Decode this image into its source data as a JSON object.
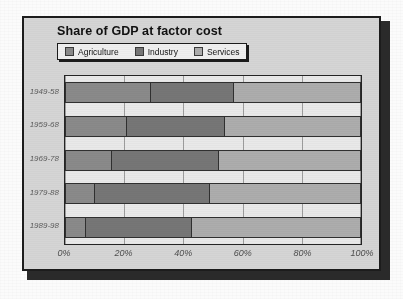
{
  "chart": {
    "title": "Share of GDP at factor cost",
    "legend": [
      {
        "label": "Agriculture",
        "color": "#8a8a8a",
        "icon": "legend-swatch-icon"
      },
      {
        "label": "Industry",
        "color": "#767676",
        "icon": "legend-swatch-icon"
      },
      {
        "label": "Services",
        "color": "#adadad",
        "icon": "legend-swatch-icon"
      }
    ],
    "panel_background": "#d5d5d5",
    "plot_background": "#e9e9e9",
    "border_color": "#1c1c1c"
  },
  "chart_data": {
    "type": "bar",
    "orientation": "horizontal",
    "stacked": true,
    "normalized": true,
    "title": "Share of GDP at factor cost",
    "xlabel": "",
    "ylabel": "",
    "xlim": [
      0,
      100
    ],
    "grid": true,
    "legend_position": "top-left",
    "categories": [
      "1949-58",
      "1959-68",
      "1969-78",
      "1979-88",
      "1989-98"
    ],
    "xticks": [
      0,
      20,
      40,
      60,
      80,
      100
    ],
    "xticklabels": [
      "0%",
      "20%",
      "40%",
      "60%",
      "80%",
      "100%"
    ],
    "series": [
      {
        "name": "Agriculture",
        "color": "#8a8a8a",
        "values": [
          29,
          21,
          16,
          10,
          7
        ]
      },
      {
        "name": "Industry",
        "color": "#767676",
        "values": [
          28,
          33,
          36,
          39,
          36
        ]
      },
      {
        "name": "Services",
        "color": "#adadad",
        "values": [
          43,
          46,
          48,
          51,
          57
        ]
      }
    ]
  }
}
